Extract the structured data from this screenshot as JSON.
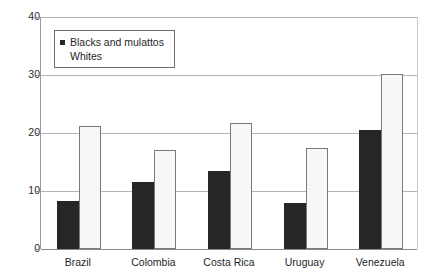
{
  "chart_data": {
    "type": "bar",
    "title": "",
    "subtitle": "",
    "xlabel": "",
    "ylabel": "",
    "ylim": [
      0,
      40
    ],
    "yticks": [
      0,
      10,
      20,
      30,
      40
    ],
    "ytick_labels": [
      "0",
      "10",
      "20",
      "30",
      "40"
    ],
    "grid": true,
    "legend_position": "upper-left-inside",
    "categories": [
      "Brazil",
      "Colombia",
      "Costa Rica",
      "Uruguay",
      "Venezuela"
    ],
    "series": [
      {
        "name": "Blacks and mulattos",
        "color": "#262626",
        "values": [
          8.3,
          11.6,
          13.4,
          7.9,
          20.5
        ]
      },
      {
        "name": "Whites",
        "color": "#f7f7f7",
        "values": [
          21.2,
          17.0,
          21.8,
          17.4,
          30.2
        ]
      }
    ]
  },
  "legend": {
    "items": [
      {
        "label": "Blacks and mulattos",
        "swatch": "dark"
      },
      {
        "label": "Whites",
        "swatch": "light"
      }
    ]
  },
  "axis": {
    "y_labels": [
      "40",
      "30",
      "20",
      "10",
      "0"
    ]
  }
}
